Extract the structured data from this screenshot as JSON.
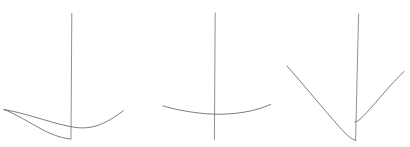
{
  "canvas": {
    "width": "410",
    "height": "147",
    "viewbox": "0 0 410 147",
    "background_color": "#ffffff",
    "stroke_color": "#666666",
    "stroke_width": "1",
    "description": "Three hand-drawn pencil-style sketches, each a thin vertical line with a curve, on a blank white background; no text or labels"
  },
  "figures": [
    {
      "name": "left-sketch",
      "description": "Vertical line with a narrow looped swoosh curve: two curves join at a sharp tip at far left, lower curve dips to the base of the vertical line, upper curve dips then rises to the right past the line",
      "paths": {
        "vertical_line": "M 71.8 13.5 L 71 138.5",
        "upper_curve": "M 4 109.5 C 30 114 56 125 76 127.5 C 96 130 110 120.5 123.5 110.5",
        "lower_curve": "M 4 109.5 C 14 113 30 123 44 130.5 C 55 136 64 138.5 71 139"
      }
    },
    {
      "name": "middle-sketch",
      "description": "Vertical line crossed near its lower end by a wide, very shallow downward-bowed curve (shallow smile shape)",
      "paths": {
        "vertical_line": "M 215.2 13 L 214.4 139.5",
        "shallow_curve": "M 163 106 C 183 111.5 203 114.5 222 114.2 C 243 113.8 259 109.5 270.5 104.5"
      }
    },
    {
      "name": "right-sketch",
      "description": "Slightly tilted vertical line with a V-shaped curve: steep left branch descending to a rounded bottom at the line's base, right branch starting partway up the line and rising to the upper right",
      "paths": {
        "vertical_line": "M 358.6 14 L 355.6 140",
        "left_branch": "M 287 66 C 303 84 326 112 339 126.5 C 346 134.5 351.5 139.5 356 140.5",
        "right_branch": "M 354.8 122 C 356.8 121.6 358.4 120.8 360 119.3 C 368 112 381 96 390 86 C 396 79.5 400.5 75 404 71.5"
      }
    }
  ]
}
